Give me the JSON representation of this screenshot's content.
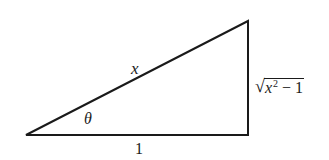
{
  "diagram": {
    "type": "right-triangle",
    "colors": {
      "stroke": "#1a1a1a",
      "background": "#ffffff"
    },
    "vertices": {
      "bottom_left": [
        26,
        135
      ],
      "bottom_right": [
        248,
        135
      ],
      "top_right": [
        248,
        21
      ]
    },
    "labels": {
      "hypotenuse": "x",
      "angle": "θ",
      "adjacent": "1",
      "opposite_radical_symbol": "√",
      "opposite_base": "x",
      "opposite_exponent": "2",
      "opposite_tail": " − 1",
      "opposite_full": "√(x² − 1)"
    }
  }
}
